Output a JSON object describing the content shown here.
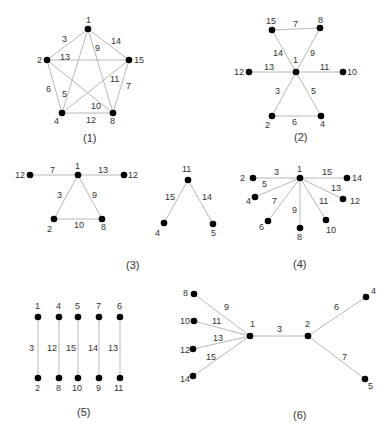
{
  "colors": {
    "edge": "#b8b8b8",
    "node": "#000000",
    "text": "#333333",
    "background": "#ffffff"
  },
  "graphs": [
    {
      "caption": "(1)",
      "caption_pos": [
        83,
        142
      ],
      "nodes": [
        {
          "id": "1",
          "label": "1",
          "x": 88,
          "y": 29,
          "lx": 86,
          "ly": 23
        },
        {
          "id": "2",
          "label": "2",
          "x": 47,
          "y": 60,
          "lx": 37,
          "ly": 63
        },
        {
          "id": "15",
          "label": "15",
          "x": 129,
          "y": 60,
          "lx": 134,
          "ly": 63
        },
        {
          "id": "4",
          "label": "4",
          "x": 62,
          "y": 113,
          "lx": 54,
          "ly": 124
        },
        {
          "id": "8",
          "label": "8",
          "x": 113,
          "y": 113,
          "lx": 110,
          "ly": 124
        }
      ],
      "edges": [
        {
          "from": "1",
          "to": "2",
          "label": "3",
          "lx": 62,
          "ly": 42
        },
        {
          "from": "1",
          "to": "15",
          "label": "14",
          "lx": 111,
          "ly": 44
        },
        {
          "from": "2",
          "to": "15",
          "label": "13",
          "lx": 60,
          "ly": 60
        },
        {
          "from": "1",
          "to": "8",
          "label": "9",
          "lx": 95,
          "ly": 51
        },
        {
          "from": "1",
          "to": "4",
          "label": "5",
          "lx": 62,
          "ly": 97
        },
        {
          "from": "2",
          "to": "4",
          "label": "6",
          "lx": 46,
          "ly": 92
        },
        {
          "from": "15",
          "to": "8",
          "label": "7",
          "lx": 126,
          "ly": 89
        },
        {
          "from": "15",
          "to": "4",
          "label": "11",
          "lx": 110,
          "ly": 82
        },
        {
          "from": "2",
          "to": "8",
          "label": "10",
          "lx": 91,
          "ly": 109
        },
        {
          "from": "4",
          "to": "8",
          "label": "12",
          "lx": 86,
          "ly": 123
        }
      ]
    },
    {
      "caption": "(2)",
      "caption_pos": [
        294,
        141
      ],
      "nodes": [
        {
          "id": "15",
          "label": "15",
          "x": 272,
          "y": 30,
          "lx": 266,
          "ly": 24
        },
        {
          "id": "8",
          "label": "8",
          "x": 320,
          "y": 28,
          "lx": 318,
          "ly": 23
        },
        {
          "id": "1",
          "label": "1",
          "x": 296,
          "y": 72,
          "lx": 293,
          "ly": 63
        },
        {
          "id": "12",
          "label": "12",
          "x": 249,
          "y": 72,
          "lx": 234,
          "ly": 75
        },
        {
          "id": "10",
          "label": "10",
          "x": 343,
          "y": 72,
          "lx": 347,
          "ly": 75
        },
        {
          "id": "2",
          "label": "2",
          "x": 272,
          "y": 116,
          "lx": 265,
          "ly": 128
        },
        {
          "id": "4",
          "label": "4",
          "x": 321,
          "y": 116,
          "lx": 320,
          "ly": 127
        }
      ],
      "edges": [
        {
          "from": "15",
          "to": "8",
          "label": "7",
          "lx": 293,
          "ly": 27
        },
        {
          "from": "15",
          "to": "1",
          "label": "14",
          "lx": 273,
          "ly": 56
        },
        {
          "from": "8",
          "to": "1",
          "label": "9",
          "lx": 310,
          "ly": 56
        },
        {
          "from": "12",
          "to": "1",
          "label": "13",
          "lx": 264,
          "ly": 70
        },
        {
          "from": "1",
          "to": "10",
          "label": "11",
          "lx": 320,
          "ly": 70
        },
        {
          "from": "1",
          "to": "2",
          "label": "3",
          "lx": 275,
          "ly": 94
        },
        {
          "from": "1",
          "to": "4",
          "label": "5",
          "lx": 311,
          "ly": 94
        },
        {
          "from": "2",
          "to": "4",
          "label": "6",
          "lx": 292,
          "ly": 125
        }
      ]
    },
    {
      "caption": "(3)",
      "caption_pos": [
        126,
        269
      ],
      "nodes": [
        {
          "id": "12a",
          "label": "12",
          "x": 30,
          "y": 175,
          "lx": 15,
          "ly": 178
        },
        {
          "id": "1",
          "label": "1",
          "x": 78,
          "y": 175,
          "lx": 75,
          "ly": 169
        },
        {
          "id": "12b",
          "label": "12",
          "x": 124,
          "y": 175,
          "lx": 128,
          "ly": 178
        },
        {
          "id": "2",
          "label": "2",
          "x": 54,
          "y": 219,
          "lx": 47,
          "ly": 232
        },
        {
          "id": "8",
          "label": "8",
          "x": 102,
          "y": 219,
          "lx": 101,
          "ly": 230
        }
      ],
      "edges": [
        {
          "from": "12a",
          "to": "1",
          "label": "7",
          "lx": 50,
          "ly": 173
        },
        {
          "from": "1",
          "to": "12b",
          "label": "13",
          "lx": 98,
          "ly": 173
        },
        {
          "from": "1",
          "to": "2",
          "label": "3",
          "lx": 57,
          "ly": 198
        },
        {
          "from": "1",
          "to": "8",
          "label": "9",
          "lx": 92,
          "ly": 198
        },
        {
          "from": "2",
          "to": "8",
          "label": "10",
          "lx": 74,
          "ly": 228
        }
      ]
    },
    {
      "caption": "",
      "caption_pos": [
        0,
        0
      ],
      "nodes": [
        {
          "id": "11",
          "label": "11",
          "x": 188,
          "y": 180,
          "lx": 182,
          "ly": 172
        },
        {
          "id": "4",
          "label": "4",
          "x": 164,
          "y": 223,
          "lx": 155,
          "ly": 236
        },
        {
          "id": "5",
          "label": "5",
          "x": 213,
          "y": 224,
          "lx": 211,
          "ly": 236
        }
      ],
      "edges": [
        {
          "from": "11",
          "to": "4",
          "label": "15",
          "lx": 165,
          "ly": 200
        },
        {
          "from": "11",
          "to": "5",
          "label": "14",
          "lx": 202,
          "ly": 200
        }
      ]
    },
    {
      "caption": "(4)",
      "caption_pos": [
        293,
        268
      ],
      "nodes": [
        {
          "id": "1",
          "label": "1",
          "x": 300,
          "y": 178,
          "lx": 297,
          "ly": 172
        },
        {
          "id": "2",
          "label": "2",
          "x": 253,
          "y": 178,
          "lx": 240,
          "ly": 181
        },
        {
          "id": "14",
          "label": "14",
          "x": 347,
          "y": 178,
          "lx": 352,
          "ly": 181
        },
        {
          "id": "4",
          "label": "4",
          "x": 255,
          "y": 197,
          "lx": 246,
          "ly": 204
        },
        {
          "id": "12",
          "label": "12",
          "x": 343,
          "y": 199,
          "lx": 350,
          "ly": 204
        },
        {
          "id": "6",
          "label": "6",
          "x": 268,
          "y": 221,
          "lx": 259,
          "ly": 230
        },
        {
          "id": "10",
          "label": "10",
          "x": 326,
          "y": 220,
          "lx": 326,
          "ly": 233
        },
        {
          "id": "8",
          "label": "8",
          "x": 300,
          "y": 228,
          "lx": 297,
          "ly": 240
        }
      ],
      "edges": [
        {
          "from": "2",
          "to": "1",
          "label": "3",
          "lx": 274,
          "ly": 175
        },
        {
          "from": "1",
          "to": "14",
          "label": "15",
          "lx": 322,
          "ly": 175
        },
        {
          "from": "1",
          "to": "4",
          "label": "5",
          "lx": 262,
          "ly": 187
        },
        {
          "from": "1",
          "to": "12",
          "label": "13",
          "lx": 331,
          "ly": 191
        },
        {
          "from": "1",
          "to": "6",
          "label": "7",
          "lx": 272,
          "ly": 204
        },
        {
          "from": "1",
          "to": "10",
          "label": "11",
          "lx": 319,
          "ly": 204
        },
        {
          "from": "1",
          "to": "8",
          "label": "9",
          "lx": 292,
          "ly": 213
        }
      ]
    },
    {
      "caption": "(5)",
      "caption_pos": [
        77,
        416
      ],
      "nodes": [
        {
          "id": "1",
          "label": "1",
          "x": 38,
          "y": 317,
          "lx": 35,
          "ly": 309
        },
        {
          "id": "2",
          "label": "2",
          "x": 38,
          "y": 378,
          "lx": 35,
          "ly": 391
        },
        {
          "id": "4",
          "label": "4",
          "x": 59,
          "y": 317,
          "lx": 56,
          "ly": 309
        },
        {
          "id": "8",
          "label": "8",
          "x": 59,
          "y": 378,
          "lx": 56,
          "ly": 391
        },
        {
          "id": "5",
          "label": "5",
          "x": 78,
          "y": 317,
          "lx": 75,
          "ly": 309
        },
        {
          "id": "10",
          "label": "10",
          "x": 78,
          "y": 378,
          "lx": 72,
          "ly": 391
        },
        {
          "id": "7",
          "label": "7",
          "x": 99,
          "y": 317,
          "lx": 96,
          "ly": 309
        },
        {
          "id": "9",
          "label": "9",
          "x": 99,
          "y": 378,
          "lx": 96,
          "ly": 391
        },
        {
          "id": "6",
          "label": "6",
          "x": 120,
          "y": 317,
          "lx": 117,
          "ly": 309
        },
        {
          "id": "11",
          "label": "11",
          "x": 120,
          "y": 378,
          "lx": 114,
          "ly": 391
        }
      ],
      "edges": [
        {
          "from": "1",
          "to": "2",
          "label": "3",
          "lx": 29,
          "ly": 351
        },
        {
          "from": "4",
          "to": "8",
          "label": "12",
          "lx": 47,
          "ly": 351
        },
        {
          "from": "5",
          "to": "10",
          "label": "15",
          "lx": 66,
          "ly": 351
        },
        {
          "from": "7",
          "to": "9",
          "label": "14",
          "lx": 88,
          "ly": 351
        },
        {
          "from": "6",
          "to": "11",
          "label": "13",
          "lx": 108,
          "ly": 351
        }
      ]
    },
    {
      "caption": "(6)",
      "caption_pos": [
        293,
        419
      ],
      "nodes": [
        {
          "id": "1",
          "label": "1",
          "x": 250,
          "y": 336,
          "lx": 250,
          "ly": 327
        },
        {
          "id": "2",
          "label": "2",
          "x": 308,
          "y": 336,
          "lx": 305,
          "ly": 327
        },
        {
          "id": "8",
          "label": "8",
          "x": 194,
          "y": 294,
          "lx": 183,
          "ly": 296
        },
        {
          "id": "10",
          "label": "10",
          "x": 194,
          "y": 321,
          "lx": 180,
          "ly": 324
        },
        {
          "id": "12",
          "label": "12",
          "x": 193,
          "y": 349,
          "lx": 180,
          "ly": 353
        },
        {
          "id": "14",
          "label": "14",
          "x": 193,
          "y": 376,
          "lx": 180,
          "ly": 382
        },
        {
          "id": "4",
          "label": "4",
          "x": 366,
          "y": 297,
          "lx": 371,
          "ly": 294
        },
        {
          "id": "5",
          "label": "5",
          "x": 365,
          "y": 379,
          "lx": 368,
          "ly": 389
        }
      ],
      "edges": [
        {
          "from": "8",
          "to": "1",
          "label": "9",
          "lx": 224,
          "ly": 310
        },
        {
          "from": "10",
          "to": "1",
          "label": "11",
          "lx": 212,
          "ly": 324
        },
        {
          "from": "12",
          "to": "1",
          "label": "13",
          "lx": 213,
          "ly": 341
        },
        {
          "from": "14",
          "to": "1",
          "label": "15",
          "lx": 206,
          "ly": 360
        },
        {
          "from": "1",
          "to": "2",
          "label": "3",
          "lx": 277,
          "ly": 332
        },
        {
          "from": "2",
          "to": "4",
          "label": "6",
          "lx": 334,
          "ly": 310
        },
        {
          "from": "2",
          "to": "5",
          "label": "7",
          "lx": 342,
          "ly": 360
        }
      ]
    }
  ]
}
